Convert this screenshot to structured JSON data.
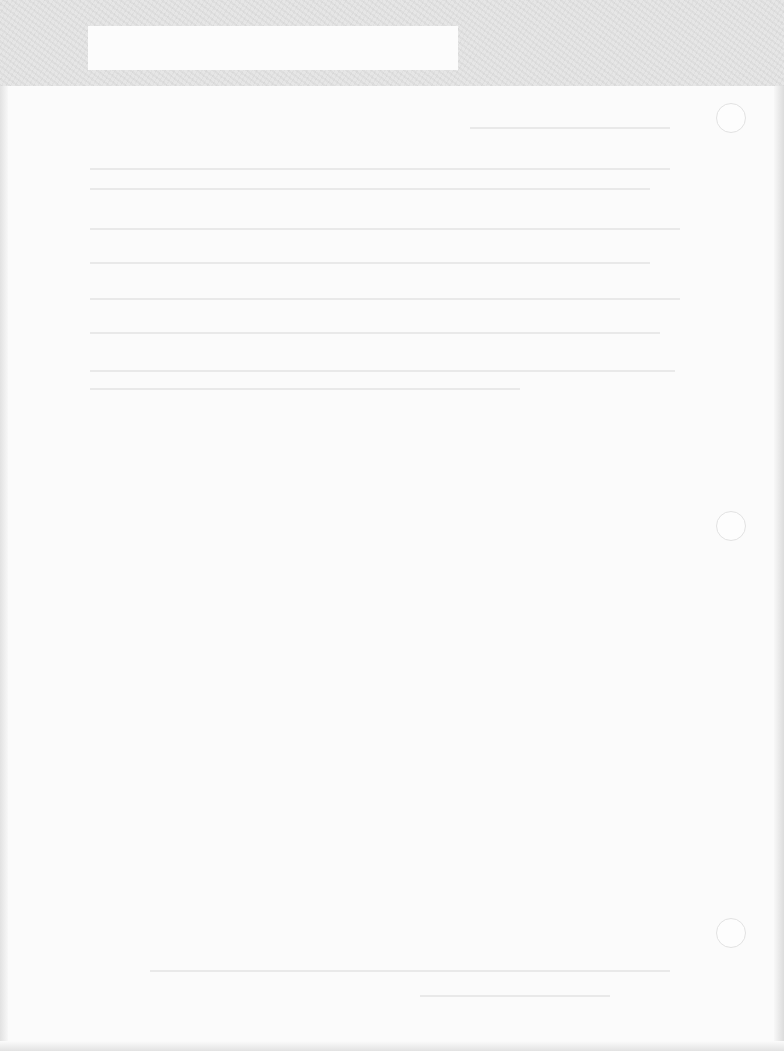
{
  "page": {
    "type": "scanned-blank-page",
    "bleed_through_heading": "",
    "bleed_through_footer": "",
    "punch_holes": 3
  },
  "colors": {
    "paper": "#fbfbfb",
    "top_band": "#e6e6e6",
    "hole_outline": "#e2e2e2"
  }
}
